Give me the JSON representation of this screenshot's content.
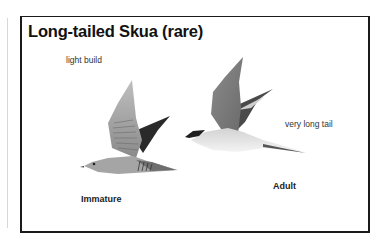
{
  "plate": {
    "title": "Long-tailed Skua (rare)",
    "annotations": {
      "light_build": "light build",
      "very_long_tail": "very long tail"
    },
    "figures": [
      {
        "label": "Immature",
        "icon": "immature-skua-illustration"
      },
      {
        "label": "Adult",
        "icon": "adult-skua-illustration"
      }
    ]
  }
}
